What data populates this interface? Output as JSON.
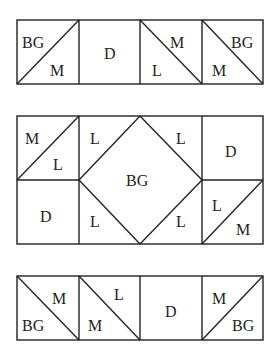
{
  "diagram": {
    "legend_codes": [
      "BG",
      "M",
      "D",
      "L"
    ],
    "top_row": {
      "squares": [
        {
          "type": "half-square-triangle",
          "diagonal": "bottom-left-to-top-right",
          "upper": "BG",
          "lower": "M"
        },
        {
          "type": "solid",
          "label": "D"
        },
        {
          "type": "half-square-triangle",
          "diagonal": "top-left-to-bottom-right",
          "upper": "M",
          "lower": "L"
        },
        {
          "type": "half-square-triangle",
          "diagonal": "top-left-to-bottom-right",
          "upper": "BG",
          "lower": "M"
        }
      ]
    },
    "middle_block": {
      "top_left": {
        "upper": "M",
        "lower": "L"
      },
      "bottom_left": {
        "label": "D"
      },
      "center_diamond": {
        "label": "BG"
      },
      "corners": {
        "top_left": "L",
        "top_right": "L",
        "bottom_left": "L",
        "bottom_right": "L"
      },
      "top_right": {
        "label": "D"
      },
      "bottom_right": {
        "upper": "L",
        "lower": "M"
      }
    },
    "bottom_row": {
      "squares": [
        {
          "type": "half-square-triangle",
          "diagonal": "top-left-to-bottom-right",
          "upper": "M",
          "lower": "BG"
        },
        {
          "type": "half-square-triangle",
          "diagonal": "top-left-to-bottom-right",
          "upper": "L",
          "lower": "M"
        },
        {
          "type": "solid",
          "label": "D"
        },
        {
          "type": "half-square-triangle",
          "diagonal": "bottom-left-to-top-right",
          "upper": "M",
          "lower": "BG"
        }
      ]
    }
  }
}
